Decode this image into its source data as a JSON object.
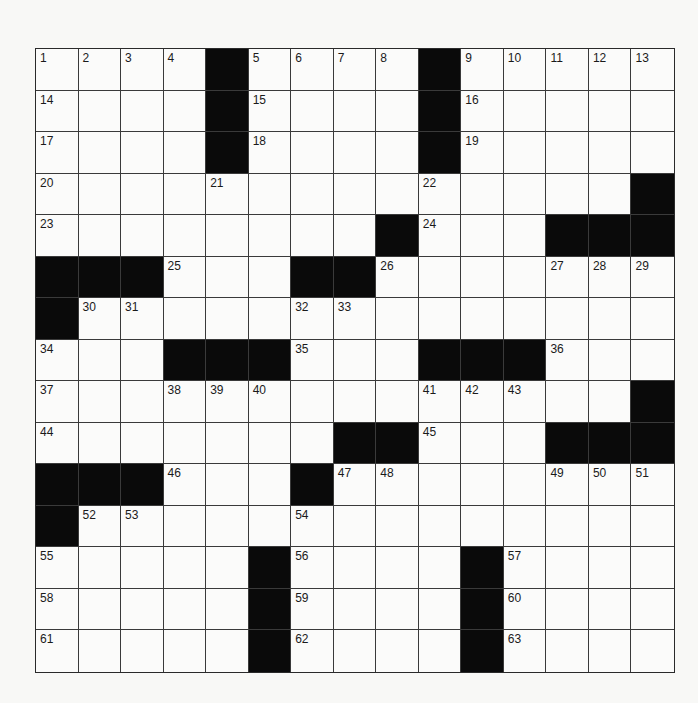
{
  "puzzle": {
    "type": "crossword",
    "rows": 15,
    "cols": 15,
    "layout": [
      "1234#5678#9ABCD",
      "....#....#.....",
      "....#....#.....",
      "....N....N....#",
      "........#N...###",
      "###N..##N...NNN",
      "#NN...NN.......",
      "N..###N...###N..",
      "N..NNN...NNN..#",
      "N......##N..###",
      "###N..#NN...NNN",
      "#NN...N........",
      "N....#N...#N...",
      "N....#N...#N...",
      "N....#N...#N..."
    ],
    "black_cells": [
      [
        0,
        4
      ],
      [
        0,
        9
      ],
      [
        1,
        4
      ],
      [
        1,
        9
      ],
      [
        2,
        4
      ],
      [
        2,
        9
      ],
      [
        3,
        14
      ],
      [
        4,
        8
      ],
      [
        4,
        12
      ],
      [
        4,
        13
      ],
      [
        4,
        14
      ],
      [
        5,
        0
      ],
      [
        5,
        1
      ],
      [
        5,
        2
      ],
      [
        5,
        6
      ],
      [
        5,
        7
      ],
      [
        6,
        0
      ],
      [
        7,
        3
      ],
      [
        7,
        4
      ],
      [
        7,
        5
      ],
      [
        7,
        9
      ],
      [
        7,
        10
      ],
      [
        7,
        11
      ],
      [
        8,
        14
      ],
      [
        9,
        7
      ],
      [
        9,
        8
      ],
      [
        9,
        12
      ],
      [
        9,
        13
      ],
      [
        9,
        14
      ],
      [
        10,
        0
      ],
      [
        10,
        1
      ],
      [
        10,
        2
      ],
      [
        10,
        6
      ],
      [
        11,
        0
      ],
      [
        12,
        5
      ],
      [
        12,
        10
      ],
      [
        13,
        5
      ],
      [
        13,
        10
      ],
      [
        14,
        5
      ],
      [
        14,
        10
      ]
    ],
    "numbers": [
      {
        "n": "1",
        "r": 0,
        "c": 0
      },
      {
        "n": "2",
        "r": 0,
        "c": 1
      },
      {
        "n": "3",
        "r": 0,
        "c": 2
      },
      {
        "n": "4",
        "r": 0,
        "c": 3
      },
      {
        "n": "5",
        "r": 0,
        "c": 5
      },
      {
        "n": "6",
        "r": 0,
        "c": 6
      },
      {
        "n": "7",
        "r": 0,
        "c": 7
      },
      {
        "n": "8",
        "r": 0,
        "c": 8
      },
      {
        "n": "9",
        "r": 0,
        "c": 10
      },
      {
        "n": "10",
        "r": 0,
        "c": 11
      },
      {
        "n": "11",
        "r": 0,
        "c": 12
      },
      {
        "n": "12",
        "r": 0,
        "c": 13
      },
      {
        "n": "13",
        "r": 0,
        "c": 14
      },
      {
        "n": "14",
        "r": 1,
        "c": 0
      },
      {
        "n": "15",
        "r": 1,
        "c": 5
      },
      {
        "n": "16",
        "r": 1,
        "c": 10
      },
      {
        "n": "17",
        "r": 2,
        "c": 0
      },
      {
        "n": "18",
        "r": 2,
        "c": 5
      },
      {
        "n": "19",
        "r": 2,
        "c": 10
      },
      {
        "n": "20",
        "r": 3,
        "c": 0
      },
      {
        "n": "21",
        "r": 3,
        "c": 4
      },
      {
        "n": "22",
        "r": 3,
        "c": 9
      },
      {
        "n": "23",
        "r": 4,
        "c": 0
      },
      {
        "n": "24",
        "r": 4,
        "c": 9
      },
      {
        "n": "25",
        "r": 5,
        "c": 3
      },
      {
        "n": "26",
        "r": 5,
        "c": 8
      },
      {
        "n": "27",
        "r": 5,
        "c": 12
      },
      {
        "n": "28",
        "r": 5,
        "c": 13
      },
      {
        "n": "29",
        "r": 5,
        "c": 14
      },
      {
        "n": "30",
        "r": 6,
        "c": 1
      },
      {
        "n": "31",
        "r": 6,
        "c": 2
      },
      {
        "n": "32",
        "r": 6,
        "c": 6
      },
      {
        "n": "33",
        "r": 6,
        "c": 7
      },
      {
        "n": "34",
        "r": 7,
        "c": 0
      },
      {
        "n": "35",
        "r": 7,
        "c": 6
      },
      {
        "n": "36",
        "r": 7,
        "c": 12
      },
      {
        "n": "37",
        "r": 8,
        "c": 0
      },
      {
        "n": "38",
        "r": 8,
        "c": 3
      },
      {
        "n": "39",
        "r": 8,
        "c": 4
      },
      {
        "n": "40",
        "r": 8,
        "c": 5
      },
      {
        "n": "41",
        "r": 8,
        "c": 9
      },
      {
        "n": "42",
        "r": 8,
        "c": 10
      },
      {
        "n": "43",
        "r": 8,
        "c": 11
      },
      {
        "n": "44",
        "r": 9,
        "c": 0
      },
      {
        "n": "45",
        "r": 9,
        "c": 9
      },
      {
        "n": "46",
        "r": 10,
        "c": 3
      },
      {
        "n": "47",
        "r": 10,
        "c": 7
      },
      {
        "n": "48",
        "r": 10,
        "c": 8
      },
      {
        "n": "49",
        "r": 10,
        "c": 12
      },
      {
        "n": "50",
        "r": 10,
        "c": 13
      },
      {
        "n": "51",
        "r": 10,
        "c": 14
      },
      {
        "n": "52",
        "r": 11,
        "c": 1
      },
      {
        "n": "53",
        "r": 11,
        "c": 2
      },
      {
        "n": "54",
        "r": 11,
        "c": 6
      },
      {
        "n": "55",
        "r": 12,
        "c": 0
      },
      {
        "n": "56",
        "r": 12,
        "c": 6
      },
      {
        "n": "57",
        "r": 12,
        "c": 11
      },
      {
        "n": "58",
        "r": 13,
        "c": 0
      },
      {
        "n": "59",
        "r": 13,
        "c": 6
      },
      {
        "n": "60",
        "r": 13,
        "c": 11
      },
      {
        "n": "61",
        "r": 14,
        "c": 0
      },
      {
        "n": "62",
        "r": 14,
        "c": 6
      },
      {
        "n": "63",
        "r": 14,
        "c": 11
      }
    ],
    "colors": {
      "black_cell": "#0a0a0a",
      "white_cell": "#fbfbfa",
      "grid_line": "#3a3a3a",
      "number_text": "#1a1a1a",
      "background": "#f8f8f6"
    }
  }
}
